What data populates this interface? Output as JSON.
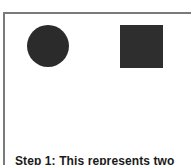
{
  "diagram": {
    "shapes": [
      {
        "type": "circle",
        "color": "#2b2b2b"
      },
      {
        "type": "square",
        "color": "#2e2e2e"
      }
    ],
    "caption": "Step 1: This represents two"
  }
}
